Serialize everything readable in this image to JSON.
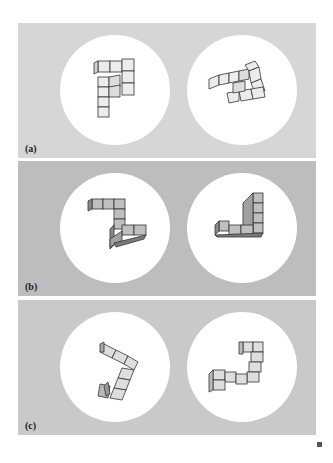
{
  "figure": {
    "panels": [
      {
        "label": "(a)",
        "background": "#d6d6d6",
        "pair": [
          "object-a-left",
          "object-a-right"
        ]
      },
      {
        "label": "(b)",
        "background": "#bdbdbd",
        "pair": [
          "object-b-left",
          "object-b-right"
        ]
      },
      {
        "label": "(c)",
        "background": "#c9c9c9",
        "pair": [
          "object-c-left",
          "object-c-right"
        ]
      }
    ],
    "disc_color": "#ffffff",
    "cube_face_color": "#ececec",
    "cube_edge_color": "#333333",
    "end_mark": "■"
  }
}
